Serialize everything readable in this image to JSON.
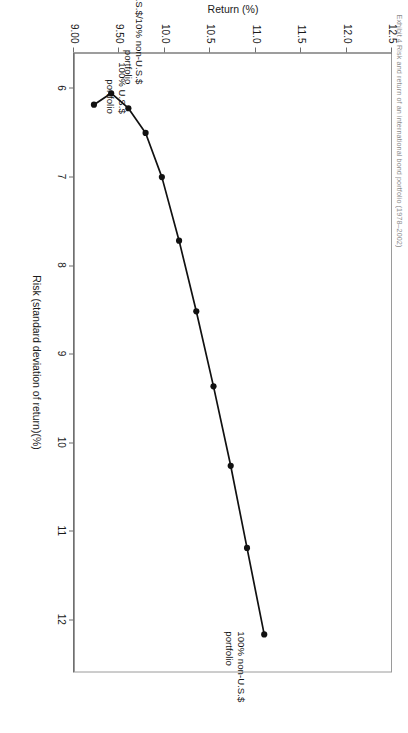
{
  "figure": {
    "caption": "Exhibit 4  Risk and return of an international bond portfolio (1978–2002)",
    "background": "#ffffff",
    "line_color": "#111111",
    "marker_color": "#111111",
    "axis_color": "#6f6f6f"
  },
  "chart_data": {
    "type": "line",
    "title": "",
    "subtitle": "",
    "xlabel": "Risk (standard deviation of return)(%)",
    "ylabel": "Return (%)",
    "xlim": [
      5.6,
      12.6
    ],
    "ylim": [
      9.0,
      12.5
    ],
    "xticks": [
      6,
      7,
      8,
      9,
      10,
      11,
      12
    ],
    "xticklabels": [
      "6",
      "7",
      "8",
      "9",
      "10",
      "11",
      "12"
    ],
    "yticks": [
      9.0,
      9.5,
      10.0,
      10.5,
      11.0,
      11.5,
      12.0,
      12.5
    ],
    "yticklabels": [
      "9.00",
      "9.50",
      "10.0",
      "10.5",
      "11.0",
      "11.5",
      "12.0",
      "12.5"
    ],
    "grid": false,
    "legend": "none",
    "marker": "filled-circle",
    "series": [
      {
        "name": "Efficient frontier (U.S.$ / non-U.S.$ bond mix)",
        "x": [
          6.18,
          6.05,
          6.22,
          6.5,
          7.0,
          7.72,
          8.52,
          9.37,
          10.27,
          11.2,
          12.18
        ],
        "y": [
          9.22,
          9.41,
          9.6,
          9.79,
          9.97,
          10.16,
          10.35,
          10.54,
          10.73,
          10.91,
          11.1
        ],
        "values": [
          {
            "label": "100% U.S.$ portfolio",
            "risk": 6.18,
            "return": 9.22
          },
          {
            "label": "90% U.S.$/10% non-U.S.$ portfolio",
            "risk": 6.05,
            "return": 9.41
          },
          {
            "label": "",
            "risk": 6.22,
            "return": 9.6
          },
          {
            "label": "",
            "risk": 6.5,
            "return": 9.79
          },
          {
            "label": "",
            "risk": 7.0,
            "return": 9.97
          },
          {
            "label": "",
            "risk": 7.72,
            "return": 10.16
          },
          {
            "label": "",
            "risk": 8.52,
            "return": 10.35
          },
          {
            "label": "",
            "risk": 9.37,
            "return": 10.54
          },
          {
            "label": "",
            "risk": 10.27,
            "return": 10.73
          },
          {
            "label": "",
            "risk": 11.2,
            "return": 10.91
          },
          {
            "label": "100% non-U.S.$ portfolio",
            "risk": 12.18,
            "return": 11.1
          }
        ]
      }
    ],
    "annotations": [
      {
        "id": "ann-non-us",
        "text": "100% non-U.S.$\nportfolio",
        "risk": 12.18,
        "return": 11.1
      },
      {
        "id": "ann-90-10",
        "text": "90% U.S.$/10% non-U.S.$\nportfolio",
        "risk": 6.05,
        "return": 9.41
      },
      {
        "id": "ann-us",
        "text": "100% U.S.$\nportfolio",
        "risk": 6.18,
        "return": 9.22
      }
    ]
  }
}
